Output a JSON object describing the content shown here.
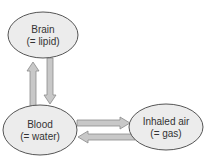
{
  "diagram": {
    "nodes": [
      {
        "id": "brain",
        "line1": "Brain",
        "line2": "(= lipid)"
      },
      {
        "id": "blood",
        "line1": "Blood",
        "line2": "(= water)"
      },
      {
        "id": "air",
        "line1": "Inhaled air",
        "line2": "(= gas)"
      }
    ],
    "edges": [
      {
        "from": "blood",
        "to": "brain"
      },
      {
        "from": "brain",
        "to": "blood"
      },
      {
        "from": "blood",
        "to": "air"
      },
      {
        "from": "air",
        "to": "blood"
      }
    ],
    "colors": {
      "node_fill": "#ececec",
      "node_stroke": "#555555",
      "arrow_fill": "#c8c8c8",
      "arrow_stroke": "#8a8a8a",
      "text": "#333333"
    }
  }
}
